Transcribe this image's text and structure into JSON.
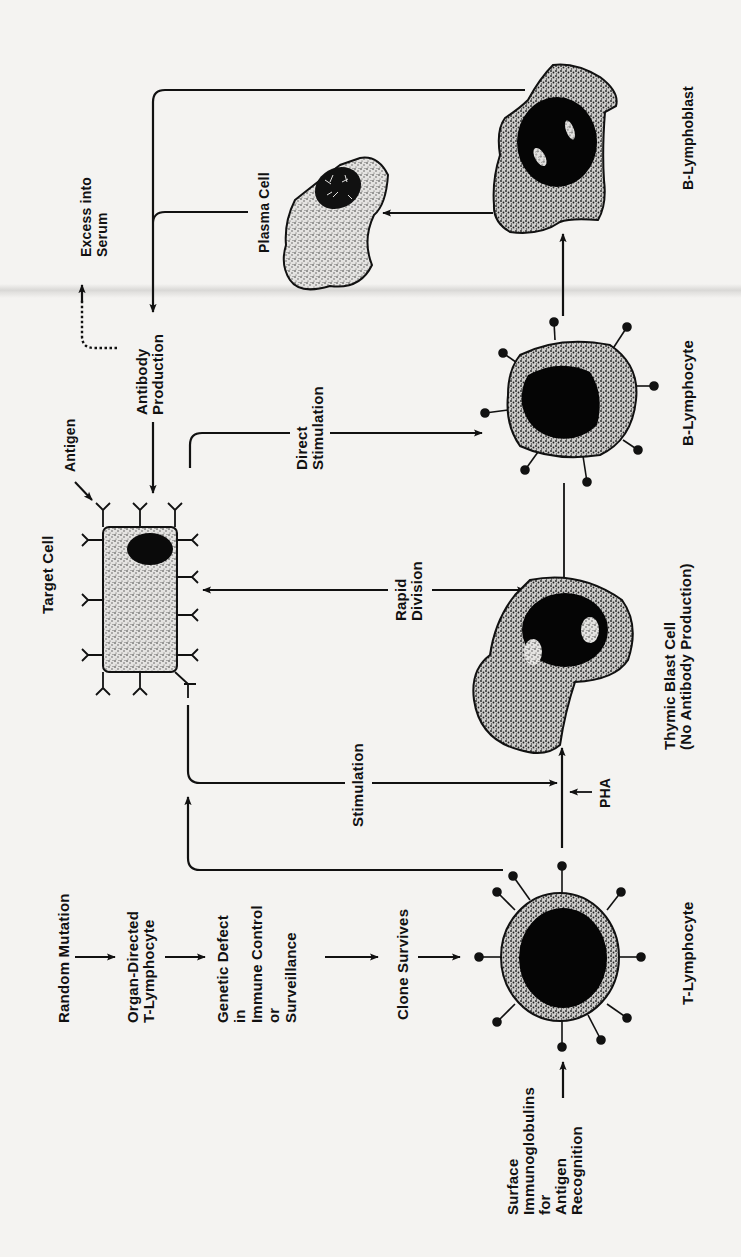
{
  "diagram": {
    "title": "",
    "orientation": "rotated 90 degrees counter-clockwise",
    "colors": {
      "ink": "#111111",
      "paper": "#f4f3f1",
      "stipple": "#8a8a8a"
    },
    "labels": {
      "random_mutation": "Random Mutation",
      "organ_directed": "Organ-Directed\nT-Lymphocyte",
      "genetic_defect": "Genetic Defect\nin\nImmune Control\nor\nSurveillance",
      "clone_survives": "Clone Survives",
      "t_lymphocyte": "T-Lymphocyte",
      "surface_ig": "Surface\nImmunoglobulins\nfor\nAntigen\nRecognition",
      "stimulation": "Stimulation",
      "pha": "PHA",
      "thymic_blast": "Thymic Blast Cell\n(No Antibody Production)",
      "target_cell": "Target Cell",
      "antigen": "Antigen",
      "rapid_division": "Rapid\nDivision",
      "direct_stimulation": "Direct\nStimulation",
      "b_lymphocyte": "B-Lymphocyte",
      "antibody_production": "Antibody\nProduction",
      "excess_into_serum": "Excess into\nSerum",
      "plasma_cell": "Plasma Cell",
      "b_lymphoblast": "B-Lymphoblast"
    },
    "nodes": [
      {
        "id": "random_mutation",
        "type": "text"
      },
      {
        "id": "organ_directed_t_lymphocyte",
        "type": "text"
      },
      {
        "id": "genetic_defect",
        "type": "text"
      },
      {
        "id": "clone_survives",
        "type": "text"
      },
      {
        "id": "t_lymphocyte",
        "type": "cell"
      },
      {
        "id": "thymic_blast_cell",
        "type": "cell"
      },
      {
        "id": "target_cell",
        "type": "cell"
      },
      {
        "id": "b_lymphocyte",
        "type": "cell"
      },
      {
        "id": "b_lymphoblast",
        "type": "cell"
      },
      {
        "id": "plasma_cell",
        "type": "cell"
      },
      {
        "id": "antibody_production",
        "type": "text"
      },
      {
        "id": "excess_into_serum",
        "type": "text"
      }
    ],
    "edges": [
      {
        "from": "random_mutation",
        "to": "organ_directed_t_lymphocyte"
      },
      {
        "from": "organ_directed_t_lymphocyte",
        "to": "genetic_defect"
      },
      {
        "from": "genetic_defect",
        "to": "clone_survives"
      },
      {
        "from": "clone_survives",
        "to": "t_lymphocyte"
      },
      {
        "from": "surface_immunoglobulins",
        "to": "t_lymphocyte"
      },
      {
        "from": "t_lymphocyte",
        "to": "thymic_blast_cell",
        "via": "PHA"
      },
      {
        "from": "t_lymphocyte",
        "to": "target_cell"
      },
      {
        "from": "target_cell",
        "to": "thymic_blast_cell",
        "label": "Stimulation"
      },
      {
        "from": "thymic_blast_cell",
        "to": "target_cell",
        "label": "Rapid Division",
        "bidirectional": true
      },
      {
        "from": "target_cell",
        "to": "b_lymphocyte",
        "label": "Direct Stimulation"
      },
      {
        "from": "thymic_blast_cell",
        "to": "b_lymphocyte",
        "style": "line"
      },
      {
        "from": "b_lymphocyte",
        "to": "b_lymphoblast"
      },
      {
        "from": "b_lymphoblast",
        "to": "plasma_cell"
      },
      {
        "from": "b_lymphoblast",
        "to": "antibody_production"
      },
      {
        "from": "plasma_cell",
        "to": "antibody_production"
      },
      {
        "from": "antibody_production",
        "to": "target_cell"
      },
      {
        "from": "antibody_production",
        "to": "excess_into_serum",
        "style": "dashed"
      }
    ]
  }
}
